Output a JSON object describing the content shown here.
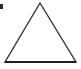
{
  "figure": {
    "canvas": {
      "width": 81,
      "height": 69,
      "background_color": "#ffffff"
    },
    "shape": {
      "name": "triangle",
      "type": "isosceles-triangle",
      "filled": false,
      "stroke_color": "#333333",
      "fill_color": "none",
      "stroke_width": 1.4,
      "vertices": [
        {
          "label": "apex",
          "x": 40,
          "y": 3
        },
        {
          "label": "bottom-right",
          "x": 76,
          "y": 62
        },
        {
          "label": "bottom-left",
          "x": 5,
          "y": 62
        }
      ],
      "points_attr": "40,3 76,62 5,62",
      "base_width": 71,
      "height": 59
    },
    "baseline": {
      "name": "base-edge",
      "x1": 5,
      "y1": 62,
      "x2": 76,
      "y2": 62,
      "stroke_color": "#1f1f1f",
      "stroke_width": 1.8
    },
    "artifact": {
      "name": "corner-mark",
      "x": 0,
      "y": 4,
      "width": 3,
      "height": 5,
      "color": "#2b2b2b"
    }
  }
}
